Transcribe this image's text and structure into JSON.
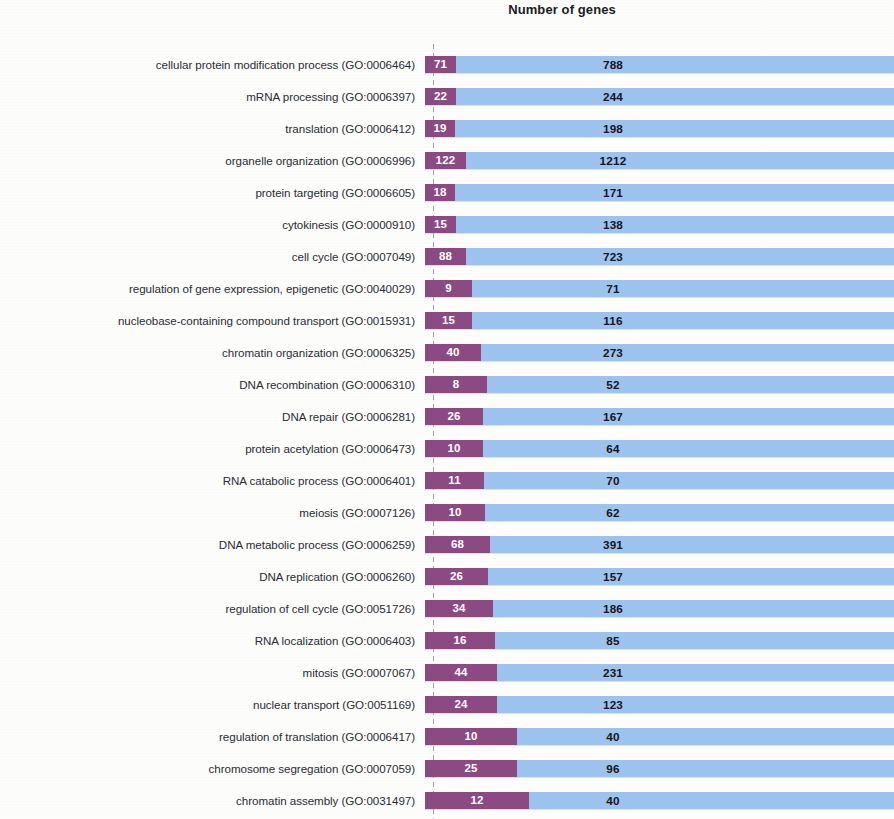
{
  "chart": {
    "title": "Number of genes"
  },
  "colors": {
    "subset_bar": "#8b4a82",
    "total_bar": "#9dc3ee",
    "subset_label": "#ffffff",
    "total_label": "#16161e",
    "axis": "#9aa0b4",
    "background": "#fdfdfc"
  },
  "chart_data": {
    "type": "bar",
    "orientation": "horizontal",
    "stacked": true,
    "title": "Number of genes",
    "xlabel": "Number of genes",
    "ylabel": "",
    "grid": false,
    "legend": false,
    "xlim": [
      0,
      1212
    ],
    "categories": [
      "cellular protein modification process (GO:0006464)",
      "mRNA processing (GO:0006397)",
      "translation (GO:0006412)",
      "organelle organization (GO:0006996)",
      "protein targeting (GO:0006605)",
      "cytokinesis (GO:0000910)",
      "cell cycle (GO:0007049)",
      "regulation of gene expression, epigenetic (GO:0040029)",
      "nucleobase-containing compound transport (GO:0015931)",
      "chromatin organization (GO:0006325)",
      "DNA recombination (GO:0006310)",
      "DNA repair (GO:0006281)",
      "protein acetylation (GO:0006473)",
      "RNA catabolic process (GO:0006401)",
      "meiosis (GO:0007126)",
      "DNA metabolic process (GO:0006259)",
      "DNA replication (GO:0006260)",
      "regulation of cell cycle (GO:0051726)",
      "RNA localization (GO:0006403)",
      "mitosis (GO:0007067)",
      "nuclear transport (GO:0051169)",
      "regulation of translation (GO:0006417)",
      "chromosome segregation (GO:0007059)",
      "chromatin assembly (GO:0031497)"
    ],
    "series": [
      {
        "name": "subset",
        "values": [
          71,
          22,
          19,
          122,
          18,
          15,
          88,
          9,
          15,
          40,
          8,
          26,
          10,
          11,
          10,
          68,
          26,
          34,
          16,
          44,
          24,
          10,
          25,
          12
        ]
      },
      {
        "name": "total",
        "values": [
          788,
          244,
          198,
          1212,
          171,
          138,
          723,
          71,
          116,
          273,
          52,
          167,
          64,
          70,
          62,
          391,
          157,
          186,
          85,
          231,
          123,
          40,
          96,
          40
        ]
      }
    ]
  },
  "rows": [
    {
      "label": "cellular protein modification process (GO:0006464)",
      "subset": 71,
      "total": 788,
      "subset_width_px": 31,
      "total_label_px": 188
    },
    {
      "label": "mRNA processing (GO:0006397)",
      "subset": 22,
      "total": 244,
      "subset_width_px": 31,
      "total_label_px": 188
    },
    {
      "label": "translation (GO:0006412)",
      "subset": 19,
      "total": 198,
      "subset_width_px": 30,
      "total_label_px": 188
    },
    {
      "label": "organelle organization (GO:0006996)",
      "subset": 122,
      "total": 1212,
      "subset_width_px": 41,
      "total_label_px": 188
    },
    {
      "label": "protein targeting (GO:0006605)",
      "subset": 18,
      "total": 171,
      "subset_width_px": 30,
      "total_label_px": 188
    },
    {
      "label": "cytokinesis (GO:0000910)",
      "subset": 15,
      "total": 138,
      "subset_width_px": 31,
      "total_label_px": 188
    },
    {
      "label": "cell cycle (GO:0007049)",
      "subset": 88,
      "total": 723,
      "subset_width_px": 41,
      "total_label_px": 188
    },
    {
      "label": "regulation of gene expression, epigenetic (GO:0040029)",
      "subset": 9,
      "total": 71,
      "subset_width_px": 47,
      "total_label_px": 188
    },
    {
      "label": "nucleobase-containing compound transport (GO:0015931)",
      "subset": 15,
      "total": 116,
      "subset_width_px": 47,
      "total_label_px": 188
    },
    {
      "label": "chromatin organization (GO:0006325)",
      "subset": 40,
      "total": 273,
      "subset_width_px": 56,
      "total_label_px": 188
    },
    {
      "label": "DNA recombination (GO:0006310)",
      "subset": 8,
      "total": 52,
      "subset_width_px": 62,
      "total_label_px": 188
    },
    {
      "label": "DNA repair (GO:0006281)",
      "subset": 26,
      "total": 167,
      "subset_width_px": 58,
      "total_label_px": 188
    },
    {
      "label": "protein acetylation (GO:0006473)",
      "subset": 10,
      "total": 64,
      "subset_width_px": 58,
      "total_label_px": 188
    },
    {
      "label": "RNA catabolic process (GO:0006401)",
      "subset": 11,
      "total": 70,
      "subset_width_px": 59,
      "total_label_px": 188
    },
    {
      "label": "meiosis (GO:0007126)",
      "subset": 10,
      "total": 62,
      "subset_width_px": 60,
      "total_label_px": 188
    },
    {
      "label": "DNA metabolic process (GO:0006259)",
      "subset": 68,
      "total": 391,
      "subset_width_px": 65,
      "total_label_px": 188
    },
    {
      "label": "DNA replication (GO:0006260)",
      "subset": 26,
      "total": 157,
      "subset_width_px": 63,
      "total_label_px": 188
    },
    {
      "label": "regulation of cell cycle (GO:0051726)",
      "subset": 34,
      "total": 186,
      "subset_width_px": 68,
      "total_label_px": 188
    },
    {
      "label": "RNA localization (GO:0006403)",
      "subset": 16,
      "total": 85,
      "subset_width_px": 70,
      "total_label_px": 188
    },
    {
      "label": "mitosis (GO:0007067)",
      "subset": 44,
      "total": 231,
      "subset_width_px": 72,
      "total_label_px": 188
    },
    {
      "label": "nuclear transport (GO:0051169)",
      "subset": 24,
      "total": 123,
      "subset_width_px": 72,
      "total_label_px": 188
    },
    {
      "label": "regulation of translation (GO:0006417)",
      "subset": 10,
      "total": 40,
      "subset_width_px": 92,
      "total_label_px": 188
    },
    {
      "label": "chromosome segregation (GO:0007059)",
      "subset": 25,
      "total": 96,
      "subset_width_px": 92,
      "total_label_px": 188
    },
    {
      "label": "chromatin assembly (GO:0031497)",
      "subset": 12,
      "total": 40,
      "subset_width_px": 104,
      "total_label_px": 188
    }
  ]
}
